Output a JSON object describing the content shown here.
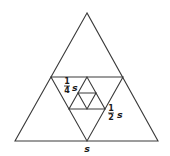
{
  "diagram": {
    "type": "nested-triangles",
    "colors": {
      "stroke": "#3a3a3a",
      "text": "#1a1a1a",
      "background": "#ffffff"
    },
    "triangles": [
      {
        "name": "outer",
        "points": "87,13 15,141 158,141"
      },
      {
        "name": "medial-inverted",
        "points": "51,77 123,77 87,141"
      },
      {
        "name": "second-upright",
        "points": "87,77 69,109 105,109"
      },
      {
        "name": "third-inverted",
        "points": "78,93 96,93 87,109"
      }
    ],
    "labels": {
      "quarter": {
        "numerator": "1",
        "denominator": "4",
        "variable": "s"
      },
      "half": {
        "numerator": "1",
        "denominator": "2",
        "variable": "s"
      },
      "full": {
        "variable": "s"
      }
    }
  }
}
